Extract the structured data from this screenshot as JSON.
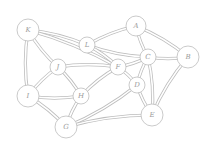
{
  "diagram": {
    "type": "undirected-graph",
    "edge_style": "double-line",
    "colors": {
      "stroke": "#bdbdbd",
      "label": "#9a9a9a",
      "background": "#ffffff"
    },
    "nodes": [
      {
        "id": "K",
        "label": "K",
        "x": 28,
        "y": 30,
        "r": 11
      },
      {
        "id": "A",
        "label": "A",
        "x": 136,
        "y": 26,
        "r": 10
      },
      {
        "id": "L",
        "label": "L",
        "x": 87,
        "y": 45,
        "r": 8
      },
      {
        "id": "C",
        "label": "C",
        "x": 148,
        "y": 57,
        "r": 8
      },
      {
        "id": "B",
        "label": "B",
        "x": 188,
        "y": 57,
        "r": 11
      },
      {
        "id": "J",
        "label": "J",
        "x": 58,
        "y": 67,
        "r": 8
      },
      {
        "id": "F",
        "label": "F",
        "x": 118,
        "y": 67,
        "r": 8
      },
      {
        "id": "D",
        "label": "D",
        "x": 137,
        "y": 85,
        "r": 8
      },
      {
        "id": "I",
        "label": "I",
        "x": 28,
        "y": 96,
        "r": 11
      },
      {
        "id": "H",
        "label": "H",
        "x": 81,
        "y": 96,
        "r": 8
      },
      {
        "id": "E",
        "label": "E",
        "x": 152,
        "y": 115,
        "r": 11
      },
      {
        "id": "G",
        "label": "G",
        "x": 66,
        "y": 127,
        "r": 11
      }
    ],
    "edges": [
      [
        "K",
        "L"
      ],
      [
        "K",
        "J"
      ],
      [
        "K",
        "F"
      ],
      [
        "K",
        "I"
      ],
      [
        "L",
        "A"
      ],
      [
        "L",
        "C"
      ],
      [
        "L",
        "F"
      ],
      [
        "A",
        "C"
      ],
      [
        "A",
        "B"
      ],
      [
        "C",
        "B"
      ],
      [
        "C",
        "F"
      ],
      [
        "C",
        "D"
      ],
      [
        "C",
        "E"
      ],
      [
        "B",
        "E"
      ],
      [
        "J",
        "F"
      ],
      [
        "J",
        "I"
      ],
      [
        "J",
        "H"
      ],
      [
        "F",
        "H"
      ],
      [
        "F",
        "D"
      ],
      [
        "D",
        "E"
      ],
      [
        "D",
        "G"
      ],
      [
        "I",
        "H"
      ],
      [
        "I",
        "G"
      ],
      [
        "H",
        "G"
      ],
      [
        "G",
        "E"
      ]
    ]
  }
}
